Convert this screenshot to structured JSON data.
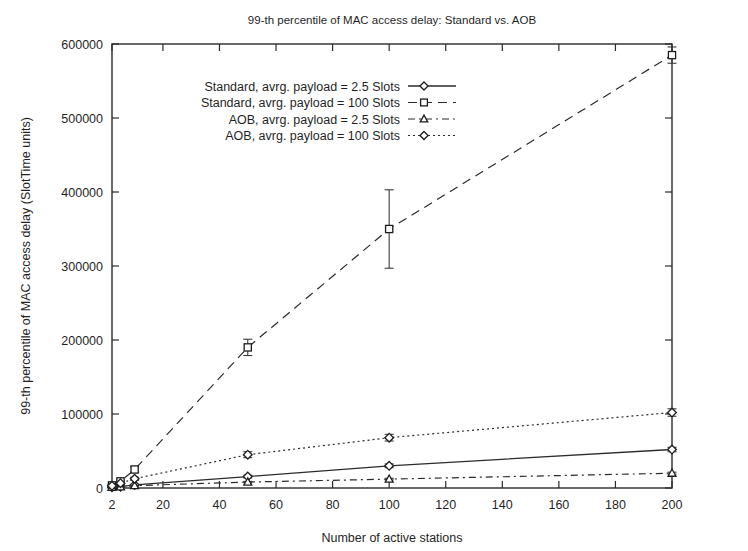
{
  "chart_data": {
    "type": "line",
    "title": "99-th percentile of MAC access delay: Standard vs. AOB",
    "xlabel": "Number of active stations",
    "ylabel": "99-th percentile of MAC access delay (SlotTime units)",
    "xlim": [
      2,
      200
    ],
    "ylim": [
      0,
      600000
    ],
    "xticks": [
      2,
      20,
      40,
      60,
      80,
      100,
      120,
      140,
      160,
      180,
      200
    ],
    "xticklabels": [
      "2",
      "20",
      "40",
      "60",
      "80",
      "100",
      "120",
      "140",
      "160",
      "180",
      "200"
    ],
    "yticks": [
      0,
      100000,
      200000,
      300000,
      400000,
      500000,
      600000
    ],
    "yticklabels": [
      "0",
      "100000",
      "200000",
      "300000",
      "400000",
      "500000",
      "600000"
    ],
    "grid": false,
    "legend_position": "upper-left-inside",
    "series": [
      {
        "name": "Standard, avrg. payload = 2.5 Slots",
        "marker": "diamond",
        "linestyle": "solid",
        "x": [
          2,
          5,
          10,
          50,
          100,
          200
        ],
        "values": [
          900,
          1800,
          4200,
          15500,
          30000,
          52000
        ],
        "errors": [
          300,
          400,
          700,
          1800,
          2500,
          3000
        ]
      },
      {
        "name": "Standard, avrg. payload = 100 Slots",
        "marker": "square",
        "linestyle": "dashed",
        "x": [
          2,
          5,
          10,
          50,
          100,
          200
        ],
        "values": [
          3500,
          9000,
          25000,
          190000,
          350000,
          585000
        ],
        "errors": [
          900,
          1800,
          3500,
          11000,
          53000,
          11000
        ]
      },
      {
        "name": "AOB, avrg. payload = 2.5 Slots",
        "marker": "triangle",
        "linestyle": "dashdot",
        "x": [
          2,
          5,
          10,
          50,
          100,
          200
        ],
        "values": [
          800,
          1500,
          3200,
          8000,
          12000,
          20000
        ],
        "errors": [
          250,
          350,
          500,
          900,
          1100,
          1400
        ]
      },
      {
        "name": "AOB, avrg. payload = 100 Slots",
        "marker": "open-diamond",
        "linestyle": "dotted",
        "x": [
          2,
          5,
          10,
          50,
          100,
          200
        ],
        "values": [
          3000,
          6500,
          12500,
          45000,
          68000,
          102000
        ],
        "errors": [
          800,
          1200,
          2000,
          4000,
          4500,
          5000
        ]
      }
    ]
  },
  "figure": {
    "background_color": "#ffffff",
    "foreground_color": "#1f1f1f"
  }
}
